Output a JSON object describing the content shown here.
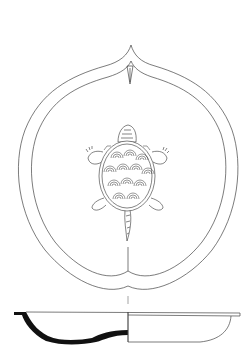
{
  "figure": {
    "views": [
      {
        "name": "plan-view",
        "description": "Top view of peach-shaped dish with central turtle decoration"
      },
      {
        "name": "cross-section",
        "description": "Profile/section of the shallow dish"
      }
    ],
    "colors": {
      "line": "#333333",
      "fill_section": "#111111",
      "background": "#ffffff"
    }
  }
}
